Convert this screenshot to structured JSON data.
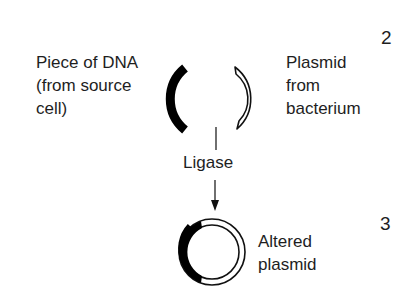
{
  "diagram": {
    "step_numbers": {
      "step2": "2",
      "step3": "3"
    },
    "dna_piece": {
      "label_lines": [
        "Piece of DNA",
        "(from source",
        "cell)"
      ],
      "icon": "dna-fragment-arc-icon",
      "fill_color": "#000000"
    },
    "plasmid": {
      "label_lines": [
        "Plasmid",
        "from",
        "bacterium"
      ],
      "icon": "open-plasmid-arc-icon"
    },
    "enzyme": {
      "label": "Ligase"
    },
    "altered_plasmid": {
      "label_lines": [
        "Altered",
        "plasmid"
      ],
      "icon": "recombinant-plasmid-ring-icon"
    }
  }
}
